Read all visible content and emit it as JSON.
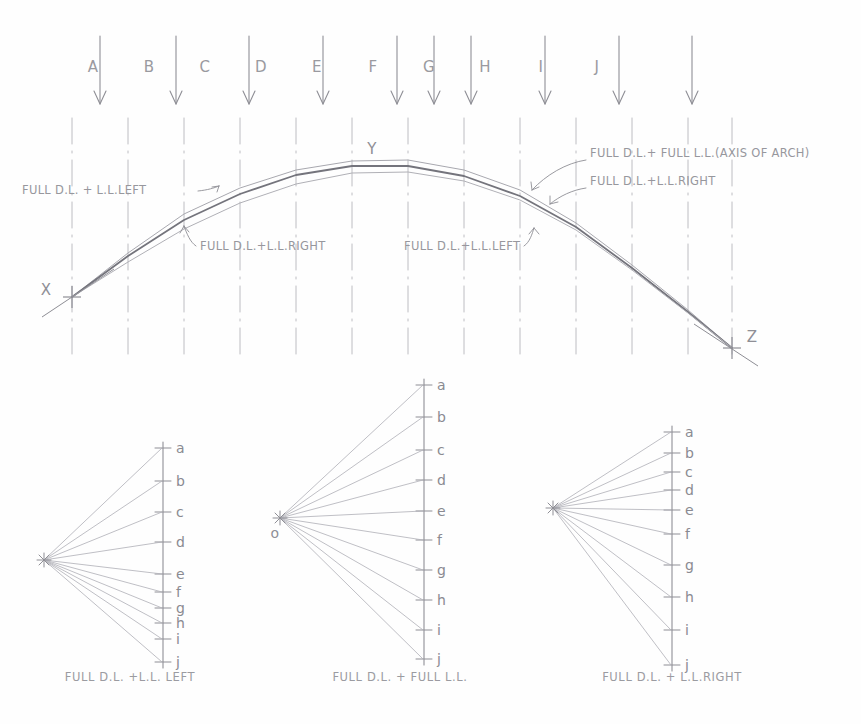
{
  "drawing": {
    "title": "Graphic statics arch analysis: funicular polygons and force diagrams",
    "ink_color": "#8e8e95",
    "ink_color_dark": "#6d6d75",
    "ink_color_light": "#b4b4ba",
    "paper_color": "#fefefe"
  },
  "load_diagram": {
    "panel_letters": [
      "A",
      "B",
      "C",
      "D",
      "E",
      "F",
      "G",
      "H",
      "I",
      "J"
    ],
    "panel_letter_x": [
      93,
      149,
      205,
      261,
      317,
      373,
      429,
      485,
      541,
      597
    ],
    "panel_letter_y": 72,
    "panel_line_x": [
      72,
      128,
      184,
      240,
      296,
      352,
      408,
      464,
      520,
      576,
      632,
      688,
      732
    ],
    "arrow_x": [
      100,
      176,
      249,
      323,
      397,
      434,
      471,
      545,
      619,
      692
    ],
    "arrow_top_y": 36,
    "arrow_tip_y": 104,
    "support_left_label": "X",
    "support_right_label": "Z",
    "crown_label": "Y",
    "support_left": {
      "x": 72,
      "y": 297
    },
    "support_right": {
      "x": 732,
      "y": 348
    },
    "crown": {
      "x": 372,
      "y": 166
    }
  },
  "arch_curves": [
    {
      "name": "full-dl-ll-left",
      "label": "FULL D.L. + L.L.LEFT",
      "weight": 1.0,
      "shade": "#a8a8af",
      "points": "72,297 128,253 184,214 240,188 296,170 352,161 408,160 464,170 520,190 576,223 632,265 688,310 732,348"
    },
    {
      "name": "full-dl-full-ll-axis",
      "label": "FULL D.L.+ FULL L.L.(AXIS OF ARCH)",
      "weight": 1.8,
      "shade": "#74747c",
      "points": "72,297 128,256 184,220 240,194 296,175 352,166 408,166 464,176 520,196 576,227 632,268 688,312 732,348"
    },
    {
      "name": "full-dl-ll-right",
      "label": "FULL D.L.+L.L.RIGHT",
      "weight": 1.0,
      "shade": "#b0b0b6",
      "points": "72,297 128,262 184,229 240,203 296,184 352,173 408,172 464,181 520,200 576,230 632,270 688,313 732,348"
    }
  ],
  "annotations": [
    {
      "id": "ann-left-ll-left",
      "text": "FULL D.L. + L.L.LEFT",
      "x": 22,
      "y": 194,
      "anchor": "start",
      "leader": "M 198,191 C 208,190 214,188 219,186"
    },
    {
      "id": "ann-left-ll-right",
      "text": "FULL D.L.+L.L.RIGHT",
      "x": 200,
      "y": 250,
      "anchor": "start",
      "leader": "M 196,246 C 190,242 187,234 184,226"
    },
    {
      "id": "ann-right-ll-left",
      "text": "FULL D.L.+L.L.LEFT",
      "x": 404,
      "y": 250,
      "anchor": "start",
      "leader": "M 524,246 C 530,242 532,234 534,228"
    },
    {
      "id": "ann-axis",
      "text": "FULL D.L.+ FULL L.L.(AXIS OF ARCH)",
      "x": 590,
      "y": 157,
      "anchor": "start",
      "leader": "M 586,160 C 566,163 546,175 532,190"
    },
    {
      "id": "ann-right-ll-right",
      "text": "FULL D.L.+L.L.RIGHT",
      "x": 590,
      "y": 185,
      "anchor": "start",
      "leader": "M 586,188 C 572,190 560,196 550,204"
    }
  ],
  "force_polygons": [
    {
      "id": "poly-left",
      "caption": "FULL D.L. +L.L. LEFT",
      "caption_x": 130,
      "caption_y": 681,
      "pole": {
        "x": 44,
        "y": 560,
        "label": ""
      },
      "line_x": 163,
      "tick_labels": [
        "a",
        "b",
        "c",
        "d",
        "e",
        "f",
        "g",
        "h",
        "i",
        "j"
      ],
      "tick_y": [
        448,
        481,
        512,
        542,
        574,
        592,
        608,
        623,
        639,
        662
      ],
      "tick_half_width": 8
    },
    {
      "id": "poly-middle",
      "caption": "FULL D.L. + FULL L.L.",
      "caption_x": 400,
      "caption_y": 681,
      "pole": {
        "x": 280,
        "y": 518,
        "label": "o"
      },
      "line_x": 424,
      "tick_labels": [
        "a",
        "b",
        "c",
        "d",
        "e",
        "f",
        "g",
        "h",
        "i",
        "j"
      ],
      "tick_y": [
        385,
        417,
        450,
        480,
        511,
        540,
        570,
        600,
        630,
        659
      ],
      "tick_half_width": 8
    },
    {
      "id": "poly-right",
      "caption": "FULL D.L. + L.L.RIGHT",
      "caption_x": 672,
      "caption_y": 681,
      "pole": {
        "x": 553,
        "y": 508,
        "label": ""
      },
      "line_x": 672,
      "tick_labels": [
        "a",
        "b",
        "c",
        "d",
        "e",
        "f",
        "g",
        "h",
        "i",
        "j"
      ],
      "tick_y": [
        432,
        453,
        472,
        490,
        510,
        534,
        565,
        597,
        630,
        665
      ],
      "tick_half_width": 8
    }
  ]
}
